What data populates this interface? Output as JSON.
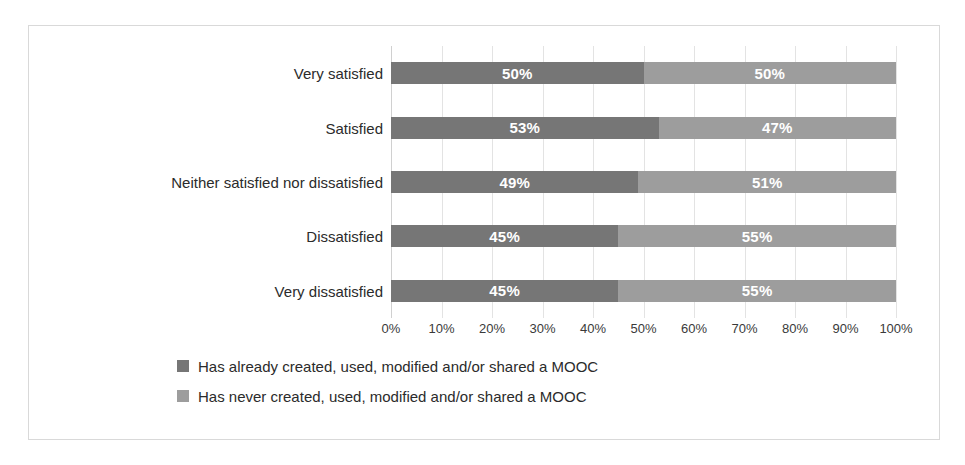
{
  "chart_data": {
    "type": "bar",
    "orientation": "horizontal",
    "stacked": true,
    "stacked_percent": true,
    "title": "",
    "xlabel": "",
    "ylabel": "",
    "xlim": [
      0,
      100
    ],
    "grid": true,
    "legend_position": "bottom",
    "categories": [
      "Very satisfied",
      "Satisfied",
      "Neither satisfied nor dissatisfied",
      "Dissatisfied",
      "Very dissatisfied"
    ],
    "tick_labels": [
      "0%",
      "10%",
      "20%",
      "30%",
      "40%",
      "50%",
      "60%",
      "70%",
      "80%",
      "90%",
      "100%"
    ],
    "tick_values": [
      0,
      10,
      20,
      30,
      40,
      50,
      60,
      70,
      80,
      90,
      100
    ],
    "series": [
      {
        "name": "Has already created, used, modified and/or shared a MOOC",
        "color": "#767676",
        "values": [
          50,
          53,
          49,
          45,
          45
        ],
        "data_labels": [
          "50%",
          "53%",
          "49%",
          "45%",
          "45%"
        ]
      },
      {
        "name": "Has never created, used, modified and/or shared a MOOC",
        "color": "#9d9d9d",
        "values": [
          50,
          47,
          51,
          55,
          55
        ],
        "data_labels": [
          "50%",
          "47%",
          "51%",
          "55%",
          "55%"
        ]
      }
    ],
    "legend": [
      {
        "label": "Has already created, used, modified and/or shared a MOOC",
        "color": "#767676"
      },
      {
        "label": "Has never created, used, modified and/or shared a MOOC",
        "color": "#9d9d9d"
      }
    ],
    "colors": {
      "series_dark": "#767676",
      "series_light": "#9d9d9d",
      "gridline": "#e3e3e3",
      "border": "#d9d9d9",
      "background": "#ffffff",
      "label_text": "#2b2b2b",
      "data_label_text": "#ffffff"
    }
  }
}
